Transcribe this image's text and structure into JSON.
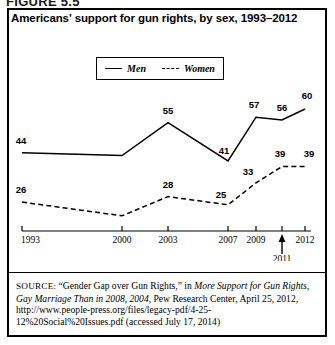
{
  "figure": {
    "number_label": "FIGURE 5.5"
  },
  "chart_title": "Americans' support for gun rights, by sex, 1993–2012",
  "legend": {
    "items": [
      {
        "label": "Men",
        "style": "solid"
      },
      {
        "label": "Women",
        "style": "dashed"
      }
    ]
  },
  "axis": {
    "tick_labels": [
      "1993",
      "2000",
      "2003",
      "2007",
      "2009",
      "2011",
      "2012"
    ],
    "callout_label": "2011",
    "callout_marker": "up-arrow"
  },
  "source": {
    "keyword": "SOURCE:",
    "text_1": " “Gender Gap over Gun Rights,” in ",
    "italic_1": "More Support for Gun Rights, Gay Marriage Than in 2008, 2004",
    "text_2": ", Pew Research Center, April 25, 2012, http://www.people-press.org/files/legacy-pdf/4-25-12%20Social%20Issues.pdf (accessed July 17, 2014)"
  },
  "colors": {
    "line": "#000000",
    "frame": "#000000",
    "background": "#ffffff"
  },
  "chart_data": {
    "type": "line",
    "title": "Americans' support for gun rights, by sex, 1993–2012",
    "xlabel": "",
    "ylabel": "",
    "x": [
      "1993",
      "2000",
      "2003",
      "2007",
      "2009",
      "2011",
      "2012"
    ],
    "xlim": [
      1993,
      2012
    ],
    "ylim": [
      18,
      64
    ],
    "grid": false,
    "legend_position": "top-center",
    "series": [
      {
        "name": "Men",
        "style": "solid",
        "values": [
          44,
          43,
          55,
          41,
          57,
          56,
          60
        ],
        "labeled_points": [
          {
            "x": "1993",
            "value": 44
          },
          {
            "x": "2003",
            "value": 55
          },
          {
            "x": "2007",
            "value": 41
          },
          {
            "x": "2009",
            "value": 57
          },
          {
            "x": "2011",
            "value": 56
          },
          {
            "x": "2012",
            "value": 60
          }
        ]
      },
      {
        "name": "Women",
        "style": "dashed",
        "values": [
          26,
          21,
          28,
          25,
          33,
          39,
          39
        ],
        "labeled_points": [
          {
            "x": "1993",
            "value": 26
          },
          {
            "x": "2003",
            "value": 28
          },
          {
            "x": "2007",
            "value": 25
          },
          {
            "x": "2009",
            "value": 33
          },
          {
            "x": "2011",
            "value": 39
          },
          {
            "x": "2012",
            "value": 39
          }
        ]
      }
    ],
    "value_labels_men": [
      "44",
      "55",
      "41",
      "57",
      "56",
      "60"
    ],
    "value_labels_women": [
      "26",
      "28",
      "25",
      "33",
      "39",
      "39"
    ]
  }
}
